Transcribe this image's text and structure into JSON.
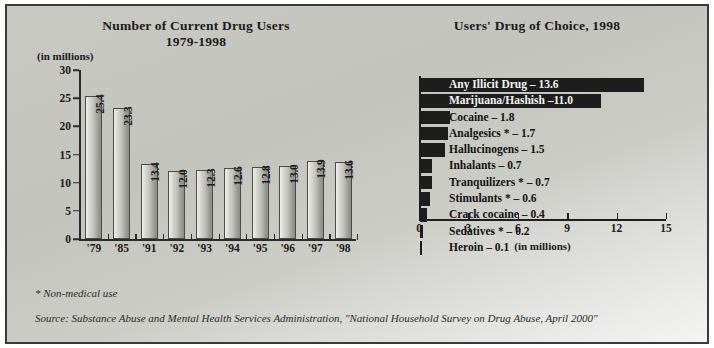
{
  "figure": {
    "footnote": "* Non-medical use",
    "source": "Source: Substance Abuse and Mental Health Services Administration, \"National Household Survey on Drug Abuse, April 2000\""
  },
  "chart_data": [
    {
      "type": "bar",
      "title": "Number of Current Drug Users",
      "subtitle": "1979-1998",
      "xlabel": "",
      "ylabel": "(in millions)",
      "ylim": [
        0,
        30
      ],
      "yticks": [
        0,
        5,
        10,
        15,
        20,
        25,
        30
      ],
      "ytick_labels": [
        "0",
        "5",
        "10",
        "15",
        "20",
        "25",
        "30"
      ],
      "grid": false,
      "categories": [
        "'79",
        "'85",
        "'91",
        "'92",
        "'93",
        "'94",
        "'95",
        "'96",
        "'97",
        "'98"
      ],
      "values": [
        25.4,
        23.3,
        13.4,
        12.0,
        12.3,
        12.6,
        12.8,
        13.0,
        13.9,
        13.6
      ],
      "value_labels": [
        "25.4",
        "23.3",
        "13.4",
        "12.0",
        "12.3",
        "12.6",
        "12.8",
        "13.0",
        "13.9",
        "13.6"
      ]
    },
    {
      "type": "bar",
      "orientation": "horizontal",
      "title": "Users' Drug of Choice, 1998",
      "xlabel": "(in millions)",
      "ylabel": "",
      "xlim": [
        0,
        15
      ],
      "xticks": [
        0,
        3,
        6,
        9,
        12,
        15
      ],
      "xtick_labels": [
        "0",
        "3",
        "6",
        "9",
        "12",
        "15"
      ],
      "grid": false,
      "categories": [
        "Any Illicit Drug",
        "Marijuana/Hashish",
        "Cocaine",
        "Analgesics *",
        "Hallucinogens",
        "Inhalants",
        "Tranquilizers *",
        "Stimulants *",
        "Crack cocaine",
        "Sedatives *",
        "Heroin"
      ],
      "values": [
        13.6,
        11.0,
        1.8,
        1.7,
        1.5,
        0.7,
        0.7,
        0.6,
        0.4,
        0.2,
        0.1
      ],
      "bar_labels": [
        "Any Illicit Drug  – 13.6",
        "Marijuana/Hashish –11.0",
        "Cocaine – 1.8",
        "Analgesics * – 1.7",
        "Hallucinogens – 1.5",
        "Inhalants – 0.7",
        "Tranquilizers * – 0.7",
        "Stimulants * – 0.6",
        "Crack cocaine – 0.4",
        "Sedatives * – 0.2",
        "Heroin – 0.1"
      ],
      "label_inverse": [
        true,
        true,
        false,
        false,
        false,
        false,
        false,
        false,
        false,
        false,
        false
      ],
      "bar_color": "#1d1d1d"
    }
  ]
}
